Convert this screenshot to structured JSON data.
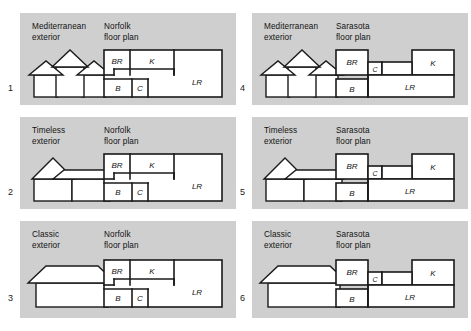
{
  "figure": {
    "background": "#ffffff",
    "panel_color": "#cfcfcf",
    "ink": "#1a1a1a",
    "rows": 3,
    "columns": 2
  },
  "labels": {
    "exterior_suffix": "exterior",
    "floorplan_suffix": "floor plan",
    "exterior_styles": [
      "Mediterranean",
      "Timeless",
      "Classic"
    ],
    "floor_plans": [
      "Norfolk",
      "Sarasota"
    ],
    "room_codes": [
      "BR",
      "K",
      "B",
      "C",
      "LR"
    ]
  },
  "cells": [
    {
      "number": "1",
      "exterior_label": "Mediterranean\nexterior",
      "plan_label": "Norfolk\nfloor plan",
      "exterior": "mediterranean",
      "plan": "norfolk",
      "rooms": [
        "BR",
        "K",
        "B",
        "C",
        "LR"
      ]
    },
    {
      "number": "2",
      "exterior_label": "Timeless\nexterior",
      "plan_label": "Norfolk\nfloor plan",
      "exterior": "timeless",
      "plan": "norfolk",
      "rooms": [
        "BR",
        "K",
        "B",
        "C",
        "LR"
      ]
    },
    {
      "number": "3",
      "exterior_label": "Classic\nexterior",
      "plan_label": "Norfolk\nfloor plan",
      "exterior": "classic",
      "plan": "norfolk",
      "rooms": [
        "BR",
        "K",
        "B",
        "C",
        "LR"
      ]
    },
    {
      "number": "4",
      "exterior_label": "Mediterranean\nexterior",
      "plan_label": "Sarasota\nfloor plan",
      "exterior": "mediterranean",
      "plan": "sarasota",
      "rooms": [
        "BR",
        "C",
        "K",
        "B",
        "LR"
      ]
    },
    {
      "number": "5",
      "exterior_label": "Timeless\nexterior",
      "plan_label": "Sarasota\nfloor plan",
      "exterior": "timeless",
      "plan": "sarasota",
      "rooms": [
        "BR",
        "C",
        "K",
        "B",
        "LR"
      ]
    },
    {
      "number": "6",
      "exterior_label": "Classic\nexterior",
      "plan_label": "Sarasota\nfloor plan",
      "exterior": "classic",
      "plan": "sarasota",
      "rooms": [
        "BR",
        "C",
        "K",
        "B",
        "LR"
      ]
    }
  ],
  "plan_rooms": {
    "norfolk": {
      "BR": "BR",
      "K": "K",
      "B": "B",
      "C": "C",
      "LR": "LR"
    },
    "sarasota": {
      "BR": "BR",
      "C": "C",
      "K": "K",
      "B": "B",
      "LR": "LR"
    }
  }
}
